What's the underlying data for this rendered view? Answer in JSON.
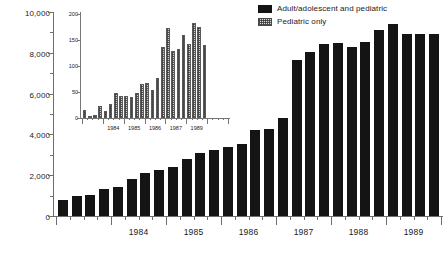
{
  "legend": {
    "position": "top-right",
    "entries": [
      {
        "label": "Adult/adolescent and pediatric",
        "swatch": "solid-black",
        "color": "#141414"
      },
      {
        "label": "Pediatric only",
        "swatch": "stippled-hatch",
        "color": "#cfcfcf"
      }
    ]
  },
  "chart_data": [
    {
      "id": "main",
      "type": "bar",
      "title": "",
      "subtitle": "",
      "series_name": "Adult/adolescent and pediatric",
      "xlabel": "",
      "ylabel": "",
      "ylim": [
        0,
        10000
      ],
      "yticks": [
        0,
        2000,
        4000,
        6000,
        8000,
        10000
      ],
      "ytick_labels": [
        "0",
        "2,000",
        "4,000",
        "6,000",
        "8,000",
        "10,000"
      ],
      "minor_yticks": [
        1000,
        3000,
        5000,
        7000,
        9000
      ],
      "grid": false,
      "bar_color": "#141414",
      "x_group_labels": [
        "1984",
        "1985",
        "1986",
        "1987",
        "1988",
        "1989"
      ],
      "categories": [
        "1983 Q1",
        "1983 Q2",
        "1983 Q3",
        "1983 Q4",
        "1984 Q1",
        "1984 Q2",
        "1984 Q3",
        "1984 Q4",
        "1985 Q1",
        "1985 Q2",
        "1985 Q3",
        "1985 Q4",
        "1986 Q1",
        "1986 Q2",
        "1986 Q3",
        "1986 Q4",
        "1987 Q1",
        "1987 Q2",
        "1987 Q3",
        "1987 Q4",
        "1988 Q1",
        "1988 Q2",
        "1988 Q3",
        "1988 Q4",
        "1989 Q1",
        "1989 Q2",
        "1989 Q3",
        "1989 Q4"
      ],
      "values": [
        800,
        1000,
        1050,
        1300,
        1400,
        1800,
        2100,
        2250,
        2400,
        2800,
        3100,
        3250,
        3400,
        3550,
        4200,
        4250,
        4800,
        7650,
        8050,
        8450,
        8500,
        8300,
        8550,
        9100,
        9400,
        8900,
        8900,
        8900
      ]
    },
    {
      "id": "inset",
      "type": "bar",
      "title": "",
      "series_name": "Pediatric only",
      "xlabel": "",
      "ylabel": "",
      "ylim": [
        0,
        200
      ],
      "yticks": [
        0,
        50,
        100,
        150,
        200
      ],
      "ytick_labels": [
        "0",
        "50",
        "100",
        "150",
        "200"
      ],
      "grid": false,
      "bar_color": "#cfcfcf",
      "x_group_labels": [
        "1984",
        "1985",
        "1986",
        "1987",
        "1989"
      ],
      "categories": [
        "1983 Q1",
        "1983 Q2",
        "1983 Q3",
        "1983 Q4",
        "1984 Q1",
        "1984 Q2",
        "1984 Q3",
        "1984 Q4",
        "1985 Q1",
        "1985 Q2",
        "1985 Q3",
        "1985 Q4",
        "1986 Q1",
        "1986 Q2",
        "1986 Q3",
        "1986 Q4",
        "1987 Q1",
        "1987 Q2",
        "1987 Q3",
        "1987 Q4",
        "1988 Q1",
        "1988 Q2",
        "1988 Q3",
        "1988 Q4",
        "1989 Q1",
        "1989 Q2",
        "1989 Q3",
        "1989 Q4"
      ],
      "values": [
        15,
        3,
        6,
        23,
        13,
        27,
        48,
        42,
        42,
        40,
        49,
        65,
        67,
        53,
        77,
        136,
        173,
        129,
        133,
        159,
        143,
        183,
        175,
        140,
        0,
        0,
        0,
        0
      ]
    }
  ]
}
